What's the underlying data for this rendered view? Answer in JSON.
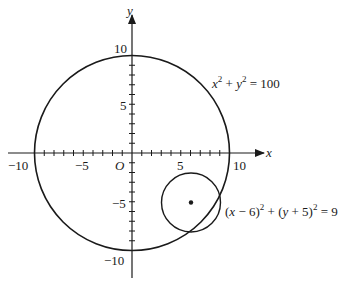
{
  "diagram": {
    "type": "coordinate-plane",
    "axes": {
      "x_label": "x",
      "y_label": "y",
      "origin_label": "O",
      "x_ticks": [
        -10,
        -5,
        10
      ],
      "x_tick_labels": [
        "−10",
        "−5",
        "10"
      ],
      "x_tick_label_five": "5",
      "y_tick_labels": {
        "pos10": "10",
        "pos5": "5",
        "neg5": "−5",
        "neg10": "−10"
      },
      "tick_interval": 1,
      "range": [
        -10,
        10
      ]
    },
    "large_circle": {
      "equation_parts": {
        "x": "x",
        "sup1": "2",
        "plus": " + ",
        "y": "y",
        "sup2": "2",
        "rhs": " = 100"
      },
      "center": [
        0,
        0
      ],
      "radius": 10
    },
    "small_circle": {
      "equation_parts": {
        "open1": "(",
        "x": "x",
        "minus": " − 6)",
        "sup1": "2",
        "plus": " + (",
        "y": "y",
        "plus5": " + 5)",
        "sup2": "2",
        "rhs": " = 9"
      },
      "center": [
        6,
        -5
      ],
      "radius": 3,
      "center_marked": true
    },
    "colors": {
      "stroke": "#1a1a1a",
      "background": "#ffffff"
    }
  }
}
